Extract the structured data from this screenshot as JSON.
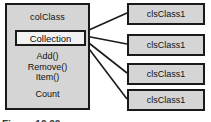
{
  "diagram": {
    "collection_class": {
      "title": "colClass",
      "field_label": "Collection",
      "methods": [
        "Add()",
        "Remove()",
        "Item()"
      ],
      "property": "Count"
    },
    "member_classes": [
      {
        "label": "clsClass1"
      },
      {
        "label": "clsClass1"
      },
      {
        "label": "clsClass1"
      },
      {
        "label": "clsClass1"
      }
    ],
    "caption": "Figure 12.22",
    "colors": {
      "box_fill": "#d5d5d5",
      "field_fill": "#f2f2f2",
      "border": "#1a1a1a",
      "line": "#1a1a1a",
      "background": "#ffffff"
    }
  }
}
